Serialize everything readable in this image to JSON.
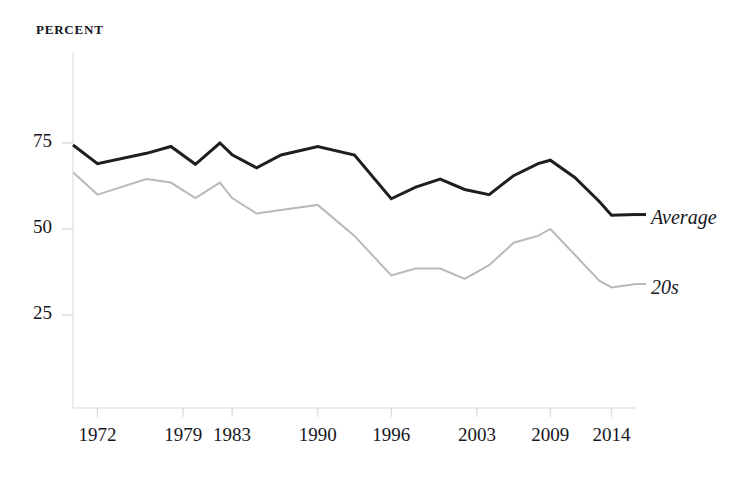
{
  "figure": {
    "unit_label": "PERCENT",
    "background": "#ffffff"
  },
  "chart_data": {
    "type": "line",
    "title": "",
    "subtitle": "",
    "xlabel": "",
    "ylabel": "PERCENT",
    "ylim": [
      0,
      100
    ],
    "xlim": [
      1970,
      2016
    ],
    "grid": false,
    "legend_position": "right-end-of-line",
    "yticks": [
      25,
      50,
      75
    ],
    "ytick_labels": [
      "25",
      "50",
      "75"
    ],
    "xticks": [
      1972,
      1979,
      1983,
      1990,
      1996,
      2003,
      2009,
      2014
    ],
    "xtick_labels": [
      "1972",
      "1979",
      "1983",
      "1990",
      "1996",
      "2003",
      "2009",
      "2014"
    ],
    "x": [
      1970,
      1972,
      1976,
      1978,
      1980,
      1982,
      1983,
      1985,
      1987,
      1990,
      1993,
      1996,
      1998,
      2000,
      2002,
      2004,
      2006,
      2008,
      2009,
      2011,
      2013,
      2014,
      2016
    ],
    "series": [
      {
        "name": "Average",
        "label": "Average",
        "color": "#1f1f22",
        "width": 3.0,
        "values": [
          74.4,
          69.0,
          72.0,
          74.0,
          68.8,
          75.0,
          71.6,
          67.8,
          71.5,
          74.0,
          71.5,
          58.8,
          62.2,
          64.5,
          61.5,
          60.0,
          65.5,
          69.0,
          70.0,
          65.0,
          58.0,
          54.0,
          54.2
        ]
      },
      {
        "name": "20s",
        "label": "20s",
        "color": "#b9b9bb",
        "width": 2.0,
        "values": [
          66.5,
          60.0,
          64.5,
          63.5,
          59.0,
          63.5,
          59.0,
          54.5,
          55.5,
          57.0,
          48.0,
          36.5,
          38.5,
          38.5,
          35.5,
          39.5,
          46.0,
          48.0,
          50.0,
          42.5,
          35.0,
          33.0,
          34.0
        ]
      }
    ]
  },
  "axes": {
    "spine_color": "#e2e2e4",
    "tick_color": "#d8d8da"
  }
}
